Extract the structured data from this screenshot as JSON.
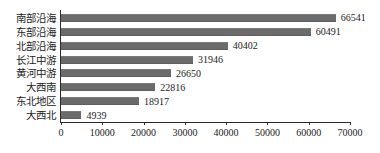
{
  "chart_data": {
    "type": "bar",
    "orientation": "horizontal",
    "title": "",
    "subtitle": "",
    "xlabel": "",
    "ylabel": "",
    "categories": [
      "南部沿海",
      "东部沿海",
      "北部沿海",
      "长江中游",
      "黄河中游",
      "大西南",
      "东北地区",
      "大西北"
    ],
    "values": [
      66541,
      60491,
      40402,
      31946,
      26650,
      22816,
      18917,
      4939
    ],
    "data_labels": [
      "66541",
      "60491",
      "40402",
      "31946",
      "26650",
      "22816",
      "18917",
      "4939"
    ],
    "xlim": [
      0,
      70000
    ],
    "x_ticks": [
      0,
      10000,
      20000,
      30000,
      40000,
      50000,
      60000,
      70000
    ],
    "x_tick_labels": [
      "0",
      "10000",
      "20000",
      "30000",
      "40000",
      "50000",
      "60000",
      "70000"
    ],
    "grid": false,
    "legend": null,
    "legend_position": "none",
    "bar_color": "#6b6b6b",
    "axis_color": "#2b2b2b",
    "text_color": "#1c1c1c",
    "background": "#ffffff"
  }
}
